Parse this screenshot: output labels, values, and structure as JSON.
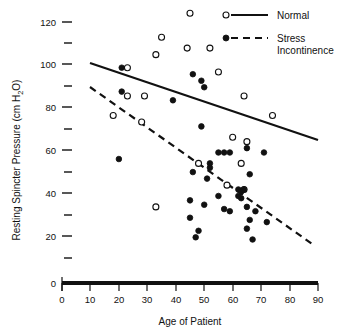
{
  "chart_data": {
    "type": "scatter",
    "title": "",
    "xlabel": "Age of Patient",
    "ylabel": "Resting Spincter Pressure (cm H₂O)",
    "ylabel_main": "Resting Spincter Pressure (cm H",
    "ylabel_sub": "2",
    "ylabel_tail": "O)",
    "xlim": [
      0,
      90
    ],
    "ylim": [
      0,
      125
    ],
    "grid": false,
    "legend_position": "top-right",
    "xticks": [
      0,
      10,
      20,
      30,
      40,
      50,
      60,
      70,
      80,
      90
    ],
    "xtick_labels": [
      "0",
      "10",
      "20",
      "30",
      "40",
      "50",
      "60",
      "70",
      "80",
      "90"
    ],
    "yticks": [
      0,
      10,
      20,
      30,
      40,
      50,
      60,
      70,
      80,
      90,
      100,
      110,
      120
    ],
    "ytick_labels": [
      "0",
      "",
      "20",
      "",
      "40",
      "",
      "60",
      "",
      "80",
      "",
      "100",
      "",
      "120"
    ],
    "series": [
      {
        "name": "Normal",
        "marker": "open-circle",
        "line_style": "solid",
        "points": [
          [
            45,
            124
          ],
          [
            35,
            113
          ],
          [
            33,
            105
          ],
          [
            44,
            108
          ],
          [
            52,
            108
          ],
          [
            23,
            99
          ],
          [
            55,
            97
          ],
          [
            23,
            86
          ],
          [
            29,
            86
          ],
          [
            64,
            86
          ],
          [
            18,
            77
          ],
          [
            74,
            77
          ],
          [
            28,
            74
          ],
          [
            60,
            67
          ],
          [
            65,
            65
          ],
          [
            48,
            55
          ],
          [
            63,
            55
          ],
          [
            58,
            45
          ],
          [
            64,
            43
          ],
          [
            33,
            35
          ]
        ],
        "fit_line": {
          "x1": 10,
          "y1": 101,
          "x2": 90,
          "y2": 66
        }
      },
      {
        "name": "Stress Incontinence",
        "marker": "filled-circle",
        "line_style": "dashed",
        "points": [
          [
            21,
            99
          ],
          [
            46,
            96
          ],
          [
            49,
            93
          ],
          [
            50,
            90
          ],
          [
            21,
            88
          ],
          [
            39,
            84
          ],
          [
            49,
            72
          ],
          [
            20,
            57
          ],
          [
            55,
            60
          ],
          [
            57,
            60
          ],
          [
            59,
            60
          ],
          [
            65,
            62
          ],
          [
            71,
            60
          ],
          [
            52,
            55
          ],
          [
            52,
            53
          ],
          [
            46,
            51
          ],
          [
            66,
            50
          ],
          [
            51,
            48
          ],
          [
            62,
            43
          ],
          [
            63,
            42
          ],
          [
            64,
            43
          ],
          [
            62,
            40
          ],
          [
            63,
            39
          ],
          [
            55,
            40
          ],
          [
            45,
            38
          ],
          [
            50,
            36
          ],
          [
            65,
            35
          ],
          [
            57,
            34
          ],
          [
            59,
            33
          ],
          [
            68,
            33
          ],
          [
            45,
            30
          ],
          [
            66,
            29
          ],
          [
            72,
            28
          ],
          [
            65,
            25
          ],
          [
            48,
            24
          ],
          [
            67,
            20
          ],
          [
            47,
            21
          ]
        ],
        "fit_line": {
          "x1": 10,
          "y1": 90,
          "x2": 89,
          "y2": 17
        }
      }
    ]
  },
  "legend": {
    "entries": [
      {
        "label": "Normal",
        "marker": "open-circle",
        "line": "solid"
      },
      {
        "label_line1": "Stress",
        "label_line2": "Incontinence",
        "marker": "filled-circle",
        "line": "dashed"
      }
    ]
  },
  "axes": {
    "x_title": "Age of Patient",
    "y_title_main": "Resting Spincter Pressure (cm H",
    "y_title_sub": "2",
    "y_title_tail": "O)"
  }
}
